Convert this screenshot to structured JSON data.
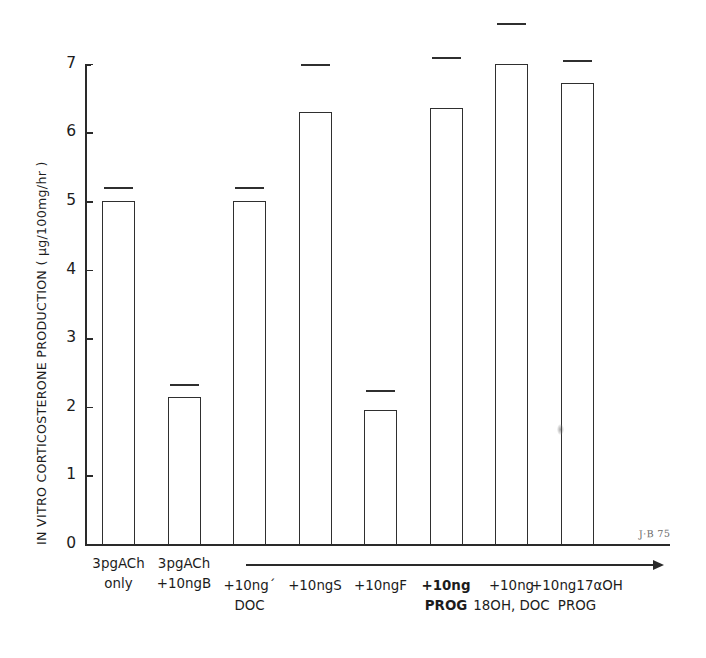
{
  "figure": {
    "signature": "J·B 75",
    "axis_color": "#2a2a2a",
    "bar_color": "#2f2f2f",
    "background": "#ffffff"
  },
  "chart_data": {
    "type": "bar",
    "title": "",
    "ylabel": "IN VITRO CORTICOSTERONE PRODUCTION ( µg/100mg/hr )",
    "xlabel": "",
    "ylim": [
      0,
      7
    ],
    "yticks": [
      "0",
      "1",
      "2",
      "3",
      "4",
      "5",
      "6",
      "7"
    ],
    "grid": false,
    "legend": null,
    "error_bars": "upper cap only (SEM)",
    "annotation_arrow_label": "",
    "categories": [
      "3pgACh\nonly",
      "3pgACh\n+10ngB",
      "+10ng´\nDOC",
      "+10ngS",
      "+10ngF",
      "+10ng\nPROG",
      "+10ng\n18OH, DOC",
      "+10ng17αOH\nPROG"
    ],
    "values": [
      5.0,
      2.15,
      5.0,
      6.3,
      1.95,
      6.35,
      7.0,
      6.72
    ],
    "error_upper": [
      5.2,
      2.33,
      5.2,
      7.0,
      2.25,
      7.1,
      7.6,
      7.05
    ],
    "bars": [
      {
        "label": "3pgACh only",
        "label_line1": "3pgACh",
        "label_line2": "only",
        "value": 5.0,
        "cap": 5.2,
        "bold": false
      },
      {
        "label": "3pgACh +10ngB",
        "label_line1": "3pgACh",
        "label_line2": "+10ngB",
        "value": 2.15,
        "cap": 2.33,
        "bold": false
      },
      {
        "label": "+10ng DOC",
        "label_line1": "+10ng´",
        "label_line2": "DOC",
        "value": 5.0,
        "cap": 5.2,
        "bold": false
      },
      {
        "label": "+10ngS",
        "label_line1": "+10ngS",
        "label_line2": "",
        "value": 6.3,
        "cap": 7.0,
        "bold": false
      },
      {
        "label": "+10ngF",
        "label_line1": "+10ngF",
        "label_line2": "",
        "value": 1.95,
        "cap": 2.25,
        "bold": false
      },
      {
        "label": "+10ng PROG",
        "label_line1": "+10ng",
        "label_line2": "PROG",
        "value": 6.35,
        "cap": 7.1,
        "bold": true
      },
      {
        "label": "+10ng 18OH, DOC",
        "label_line1": "+10ng",
        "label_line2": "18OH, DOC",
        "value": 7.0,
        "cap": 7.6,
        "bold": false
      },
      {
        "label": "+10ng17αOH PROG",
        "label_line1": "+10ng17αOH",
        "label_line2": "PROG",
        "value": 6.72,
        "cap": 7.05,
        "bold": false
      }
    ]
  }
}
